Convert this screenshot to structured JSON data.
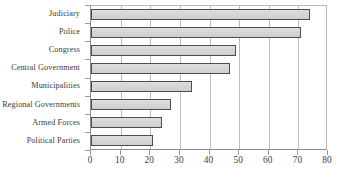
{
  "chart_data": {
    "type": "bar",
    "orientation": "horizontal",
    "title": "",
    "subtitle": "",
    "xlabel": "",
    "ylabel": "",
    "xlim": [
      0,
      80
    ],
    "xticks": [
      0,
      10,
      20,
      30,
      40,
      50,
      60,
      70,
      80
    ],
    "xtick_labels": [
      "0",
      "10",
      "20",
      "30",
      "40",
      "50",
      "60",
      "70",
      "80"
    ],
    "grid": "vertical",
    "legend": "none",
    "categories": [
      "Judiciary",
      "Police",
      "Congress",
      "Central Government",
      "Municipalities",
      "Regional Governments",
      "Armed Forces",
      "Political Parties"
    ],
    "values": [
      74,
      71,
      49,
      47,
      34,
      27,
      24,
      21
    ],
    "series": [
      {
        "name": "",
        "values": [
          74,
          71,
          49,
          47,
          34,
          27,
          24,
          21
        ]
      }
    ],
    "colors": {
      "bar_fill": "#d8d8d8",
      "bar_border": "#4d4d4d",
      "gridline": "#bcbcbc",
      "axis": "#8d8d8d",
      "text": "#3b3b3b",
      "background": "#ffffff"
    }
  }
}
